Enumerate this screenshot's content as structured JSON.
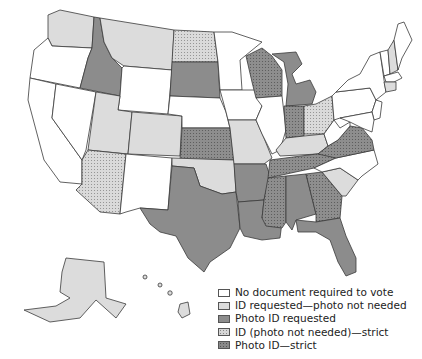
{
  "map": {
    "title": "Voter identification requirements by state",
    "colors": {
      "none": "#ffffff",
      "id_requested": "#dcdcdc",
      "photo_requested": "#8c8c8c",
      "id_strict": "#d6d6d6",
      "photo_strict": "#8a8a8a",
      "border": "#3a3a3a"
    },
    "categories": {
      "no_document": [
        "WA?",
        "OR",
        "CA",
        "NV",
        "WY",
        "NM",
        "NE",
        "MN",
        "IA",
        "IL",
        "WV",
        "NC",
        "PA",
        "NY",
        "VT",
        "ME",
        "MA",
        "NJ",
        "MD",
        "DE"
      ],
      "id_requested_photo_not_needed": [
        "WA",
        "MT",
        "UT",
        "CO",
        "OK",
        "MO",
        "KY",
        "SC",
        "AK",
        "NH",
        "CT"
      ],
      "photo_id_requested": [
        "ID",
        "SD",
        "TX",
        "AR",
        "LA",
        "FL",
        "MI",
        "AL",
        "HI"
      ],
      "id_photo_not_needed_strict": [
        "ND",
        "AZ",
        "OH"
      ],
      "photo_id_strict": [
        "KS",
        "WI",
        "IN",
        "TN",
        "MS",
        "GA",
        "VA"
      ]
    }
  },
  "legend": {
    "items": [
      {
        "label": "No document required to vote",
        "fill": "#ffffff",
        "pattern": "none"
      },
      {
        "label": "ID requested—photo not needed",
        "fill": "#dcdcdc",
        "pattern": "none"
      },
      {
        "label": "Photo ID requested",
        "fill": "#8c8c8c",
        "pattern": "none"
      },
      {
        "label": "ID (photo not needed)—strict",
        "fill": "#d6d6d6",
        "pattern": "dots"
      },
      {
        "label": "Photo ID—strict",
        "fill": "#8a8a8a",
        "pattern": "dots"
      }
    ]
  }
}
